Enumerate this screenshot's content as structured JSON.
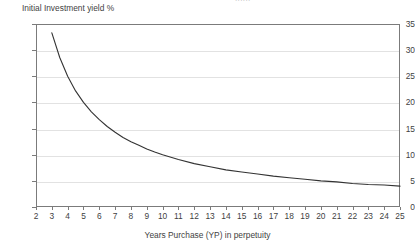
{
  "chart_data": {
    "type": "line",
    "title": "",
    "cropped_top_text": "......",
    "ylabel": "Initial Investment yield %",
    "xlabel": "Years Purchase (YP) in perpetuity",
    "xlim": [
      2,
      25
    ],
    "ylim": [
      0,
      35
    ],
    "grid": true,
    "legend": null,
    "x_ticks": [
      2,
      3,
      4,
      5,
      6,
      7,
      8,
      9,
      10,
      11,
      12,
      13,
      14,
      15,
      16,
      17,
      18,
      19,
      20,
      21,
      22,
      23,
      24,
      25
    ],
    "y_ticks": [
      0,
      5,
      10,
      15,
      20,
      25,
      30,
      35
    ],
    "series": [
      {
        "name": "Initial Investment yield %",
        "color": "#333333",
        "x": [
          3,
          3.5,
          4,
          4.5,
          5,
          5.5,
          6,
          6.5,
          7,
          7.5,
          8,
          8.5,
          9,
          9.5,
          10,
          11,
          12,
          13,
          14,
          15,
          16,
          17,
          18,
          19,
          20,
          21,
          22,
          23,
          24,
          25
        ],
        "values": [
          33.3,
          28.6,
          25.0,
          22.2,
          20.0,
          18.2,
          16.7,
          15.4,
          14.3,
          13.3,
          12.5,
          11.8,
          11.1,
          10.5,
          10.0,
          9.1,
          8.3,
          7.7,
          7.1,
          6.7,
          6.3,
          5.9,
          5.6,
          5.3,
          5.0,
          4.8,
          4.5,
          4.3,
          4.2,
          4.0
        ]
      }
    ]
  },
  "colors": {
    "curve": "#333333",
    "grid": "#e2e2e2",
    "frame": "#7b7b7b",
    "text": "#3f3f3f",
    "background": "#ffffff"
  }
}
